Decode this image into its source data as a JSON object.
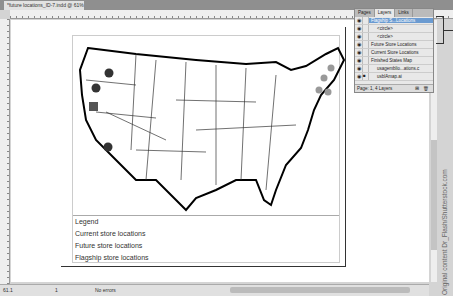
{
  "window": {
    "doc_tab": "*future locations_ID-7.indd @ 61%",
    "tab_close": "×"
  },
  "ruler": {
    "labels": [
      "0",
      "1",
      "2",
      "3",
      "4",
      "5"
    ]
  },
  "legend": {
    "title": "Legend",
    "items": [
      "Current store locations",
      "Future store locations",
      "Flagship store locations"
    ]
  },
  "layers_panel": {
    "tabs": [
      "Pages",
      "Layers",
      "Links"
    ],
    "rows": [
      {
        "name": "Flagship S...Locations",
        "selected": true
      },
      {
        "name": "<circle>"
      },
      {
        "name": "<circle>"
      },
      {
        "name": "Future Store Locations"
      },
      {
        "name": "Current Store Locations"
      },
      {
        "name": "Finished States Map"
      },
      {
        "name": "usagemblio...ations.c"
      },
      {
        "name": "usblAmap.ai"
      }
    ],
    "footer": "Page: 1, 4 Layers"
  },
  "statusbar": {
    "zoom": "61.1",
    "page": "1",
    "errors": "No errors"
  },
  "credit": "Original content Dr_Flash/Shutterstock.com",
  "colors": {
    "current": "#333333",
    "future": "#9a9a9a",
    "selected_layer": "#6b9bd1"
  }
}
